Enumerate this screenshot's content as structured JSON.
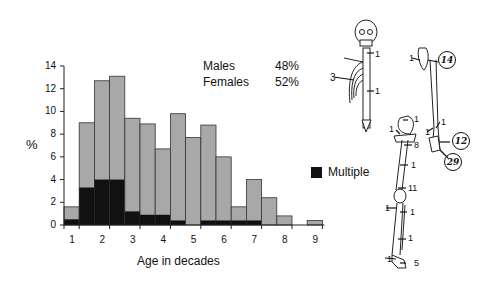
{
  "chart_data": {
    "type": "bar",
    "stacked": true,
    "title": "",
    "xlabel": "Age in decades",
    "ylabel": "%",
    "ylim": [
      0,
      14
    ],
    "yticks": [
      "0",
      "2",
      "4",
      "6",
      "8",
      "10",
      "12",
      "14"
    ],
    "xticks": [
      "1",
      "2",
      "3",
      "4",
      "5",
      "6",
      "7",
      "8",
      "9"
    ],
    "bin_width_decades": 0.5,
    "categories": [
      "0.5-1",
      "1-1.5",
      "1.5-2",
      "2-2.5",
      "2.5-3",
      "3-3.5",
      "3.5-4",
      "4-4.5",
      "4.5-5",
      "5-5.5",
      "5.5-6",
      "6-6.5",
      "6.5-7",
      "7-7.5",
      "7.5-8",
      "8-8.5",
      "8.5-9"
    ],
    "series": [
      {
        "name": "Total",
        "color": "#a8a8a8",
        "values": [
          1.6,
          9.0,
          12.7,
          13.1,
          9.4,
          8.9,
          6.7,
          9.8,
          7.7,
          8.8,
          6.0,
          1.6,
          4.0,
          2.4,
          0.8,
          0,
          0.4
        ]
      },
      {
        "name": "Multiple",
        "color": "#111111",
        "values": [
          0.5,
          3.3,
          4.0,
          4.0,
          1.2,
          0.9,
          0.9,
          0.4,
          0,
          0.4,
          0.4,
          0.4,
          0.4,
          0,
          0,
          0,
          0
        ]
      }
    ],
    "legend": [
      {
        "label": "Multiple",
        "color": "#111111"
      }
    ],
    "annotations": {
      "males": "Males",
      "males_pct": "48%",
      "females": "Females",
      "females_pct": "52%"
    }
  },
  "skeleton": {
    "labels": {
      "neck": "1",
      "ribs": "3",
      "spine": "1",
      "scapula": "1",
      "humerus_circle": "14",
      "elbow_a": "1",
      "elbow_b": "1",
      "wrist_circle": "12",
      "hand_circle": "29",
      "pelvis": "1",
      "hip": "1",
      "femur_top": "8",
      "femur_mid": "1",
      "knee": "11",
      "tibia_a": "1",
      "tibia_b": "1",
      "tibia_c": "1",
      "ankle": "1",
      "foot": "5"
    }
  }
}
